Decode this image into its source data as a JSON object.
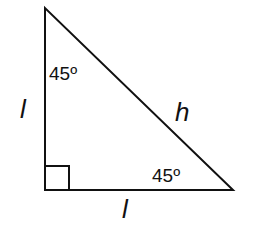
{
  "diagram": {
    "type": "right isosceles triangle (45-45-90)",
    "vertices": {
      "top": [
        45,
        8
      ],
      "right_angle": [
        45,
        190
      ],
      "bottom_right": [
        233,
        190
      ]
    },
    "labels": {
      "top_angle": "45º",
      "bottom_right_angle": "45º",
      "left_leg": "l",
      "bottom_leg": "l",
      "hypotenuse": "h"
    },
    "right_angle_marker": true,
    "stroke_color": "#111111"
  }
}
